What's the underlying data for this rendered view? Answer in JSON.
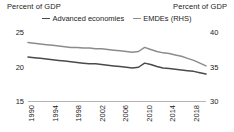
{
  "header": {
    "left_axis_title": "Percent of GDP",
    "right_axis_title": "Percent of GDP"
  },
  "legend": {
    "position": "top-center",
    "items": [
      {
        "label": "Advanced economies",
        "color": "#4a4a4a"
      },
      {
        "label": "EMDEs (RHS)",
        "color": "#8c8c8c"
      }
    ]
  },
  "axes": {
    "left_ticks": [
      "25",
      "20",
      "15"
    ],
    "right_ticks": [
      "40",
      "35",
      "30"
    ],
    "x_ticks": [
      "1990",
      "1994",
      "1998",
      "2002",
      "2006",
      "2010",
      "2014",
      "2018"
    ]
  },
  "chart_data": {
    "type": "line",
    "title": "",
    "subtitle": "",
    "xlabel": "",
    "ylabel": "Percent of GDP",
    "y2label": "Percent of GDP",
    "ylim": [
      15,
      25
    ],
    "y2lim": [
      30,
      40
    ],
    "yticks": [
      15,
      20,
      25
    ],
    "y2ticks": [
      30,
      35,
      40
    ],
    "xlim": [
      1990,
      2019
    ],
    "xticks": [
      1990,
      1994,
      1998,
      2002,
      2006,
      2010,
      2014,
      2018
    ],
    "grid": false,
    "legend_position": "top-center",
    "x": [
      1990,
      1991,
      1992,
      1993,
      1994,
      1995,
      1996,
      1997,
      1998,
      1999,
      2000,
      2001,
      2002,
      2003,
      2004,
      2005,
      2006,
      2007,
      2008,
      2009,
      2010,
      2011,
      2012,
      2013,
      2014,
      2015,
      2016,
      2017,
      2018,
      2019
    ],
    "series": [
      {
        "name": "Advanced economies",
        "axis": "left",
        "color": "#4a4a4a",
        "values": [
          21.5,
          21.4,
          21.3,
          21.2,
          21.1,
          21.0,
          20.9,
          20.8,
          20.7,
          20.6,
          20.5,
          20.5,
          20.4,
          20.3,
          20.2,
          20.1,
          20.0,
          19.9,
          20.0,
          20.6,
          20.4,
          20.1,
          19.9,
          19.8,
          19.7,
          19.6,
          19.5,
          19.4,
          19.2,
          19.0
        ]
      },
      {
        "name": "EMDEs (RHS)",
        "axis": "right",
        "color": "#8c8c8c",
        "values": [
          38.6,
          38.5,
          38.4,
          38.3,
          38.2,
          38.1,
          38.0,
          37.9,
          37.9,
          37.8,
          37.8,
          37.7,
          37.7,
          37.6,
          37.5,
          37.4,
          37.3,
          37.2,
          37.3,
          37.9,
          37.6,
          37.3,
          37.1,
          37.0,
          36.8,
          36.6,
          36.3,
          36.0,
          35.6,
          35.2
        ]
      }
    ]
  }
}
